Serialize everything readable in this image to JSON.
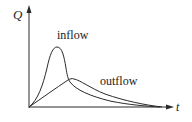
{
  "diagram": {
    "type": "hydrograph",
    "axes": {
      "y_label": "Q",
      "x_label": "t"
    },
    "curves": [
      {
        "name": "inflow",
        "label": "inflow",
        "description": "sharp early peak"
      },
      {
        "name": "outflow",
        "label": "outflow",
        "description": "attenuated, delayed peak"
      }
    ],
    "colors": {
      "line": "#2a2a2a",
      "background": "#ffffff"
    }
  }
}
